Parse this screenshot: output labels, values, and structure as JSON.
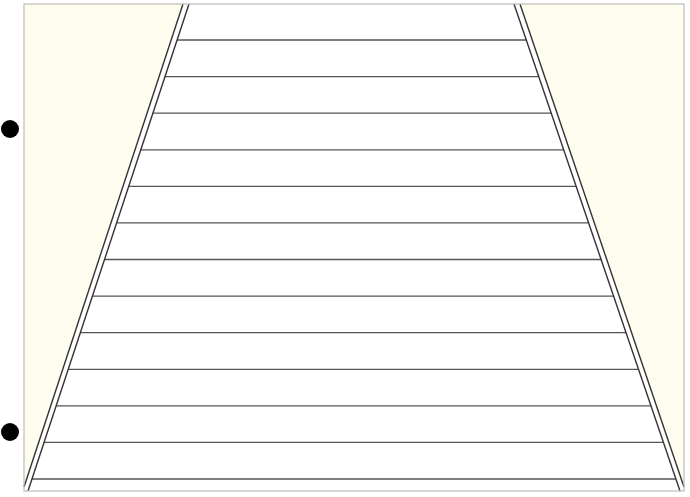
{
  "diagram": {
    "colors": {
      "background": "#ffffff",
      "shade": "#fefdef",
      "frame": "#bdbdbd",
      "line": "#333333",
      "rung": "#555555",
      "marker": "#000000"
    },
    "rung_count": 13,
    "marker_count": 2,
    "side_lines": "double"
  }
}
